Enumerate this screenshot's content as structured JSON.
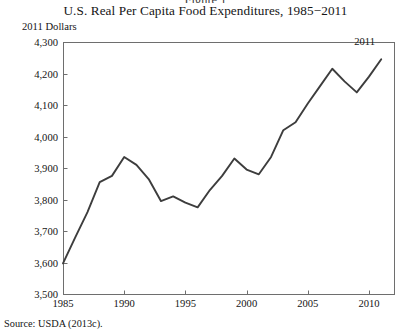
{
  "figure": {
    "cut_off_top_text": "Figure 1",
    "title": "U.S. Real Per Capita Food Expenditures, 1985−2011",
    "axis_unit_label": "2011 Dollars",
    "source": "Source: USDA (2013c).",
    "end_annotation": "2011",
    "line_color": "#3d3d3d",
    "axis_color": "#6e6e6e"
  },
  "chart_data": {
    "type": "line",
    "title": "U.S. Real Per Capita Food Expenditures, 1985−2011",
    "xlabel": "",
    "ylabel": "2011 Dollars",
    "xlim": [
      1985,
      2011
    ],
    "ylim": [
      3500,
      4300
    ],
    "grid": false,
    "legend": null,
    "xticks": [
      1985,
      1990,
      1995,
      2000,
      2005,
      2010
    ],
    "xtick_labels": [
      "1985",
      "1990",
      "1995",
      "2000",
      "2005",
      "2010"
    ],
    "yticks": [
      3500,
      3600,
      3700,
      3800,
      3900,
      4000,
      4100,
      4200,
      4300
    ],
    "ytick_labels": [
      "3,500",
      "3,600",
      "3,700",
      "3,800",
      "3,900",
      "4,000",
      "4,100",
      "4,200",
      "4,300"
    ],
    "annotations": [
      {
        "text": "2011",
        "x": 2011,
        "y": 4245,
        "position": "above-right"
      }
    ],
    "x": [
      1985,
      1986,
      1987,
      1988,
      1989,
      1990,
      1991,
      1992,
      1993,
      1994,
      1995,
      1996,
      1997,
      1998,
      1999,
      2000,
      2001,
      2002,
      2003,
      2004,
      2005,
      2006,
      2007,
      2008,
      2009,
      2010,
      2011
    ],
    "values": [
      3597,
      3680,
      3760,
      3855,
      3875,
      3935,
      3910,
      3865,
      3795,
      3810,
      3790,
      3775,
      3830,
      3875,
      3930,
      3895,
      3880,
      3935,
      4020,
      4045,
      4105,
      4160,
      4215,
      4175,
      4140,
      4190,
      4245
    ],
    "series": [
      {
        "name": "U.S. Real Per Capita Food Expenditures",
        "values": [
          3597,
          3680,
          3760,
          3855,
          3875,
          3935,
          3910,
          3865,
          3795,
          3810,
          3790,
          3775,
          3830,
          3875,
          3930,
          3895,
          3880,
          3935,
          4020,
          4045,
          4105,
          4160,
          4215,
          4175,
          4140,
          4190,
          4245
        ]
      }
    ]
  }
}
